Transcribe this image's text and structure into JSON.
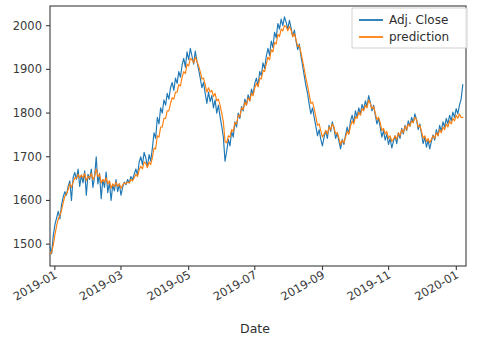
{
  "chart_data": {
    "type": "line",
    "title": "",
    "xlabel": "Date",
    "ylabel": "",
    "grid": false,
    "legend_position": "upper right",
    "xtick_labels": [
      "2019-01",
      "2019-03",
      "2019-05",
      "2019-07",
      "2019-09",
      "2019-11",
      "2020-01"
    ],
    "xtick_values": [
      0,
      41,
      83,
      124,
      166,
      207,
      249
    ],
    "ytick_labels": [
      "1500",
      "1600",
      "1700",
      "1800",
      "1900",
      "2000"
    ],
    "ytick_values": [
      1500,
      1600,
      1700,
      1800,
      1900,
      2000
    ],
    "ylim": [
      1450,
      2045
    ],
    "xlim": [
      -3,
      255
    ],
    "colors": {
      "adj_close": "#1f77b4",
      "prediction": "#ff7f0e",
      "axis": "#3b3b3b",
      "background": "#ffffff"
    },
    "series": [
      {
        "name": "Adj. Close",
        "color": "#1f77b4",
        "values": [
          1495,
          1478,
          1520,
          1545,
          1560,
          1575,
          1558,
          1590,
          1608,
          1620,
          1612,
          1632,
          1645,
          1600,
          1652,
          1664,
          1648,
          1672,
          1632,
          1658,
          1640,
          1668,
          1612,
          1660,
          1648,
          1672,
          1630,
          1655,
          1700,
          1638,
          1662,
          1604,
          1648,
          1630,
          1665,
          1618,
          1642,
          1600,
          1636,
          1622,
          1648,
          1620,
          1638,
          1612,
          1630,
          1642,
          1636,
          1648,
          1640,
          1655,
          1648,
          1660,
          1672,
          1658,
          1688,
          1700,
          1682,
          1710,
          1698,
          1676,
          1705,
          1690,
          1720,
          1755,
          1742,
          1790,
          1775,
          1812,
          1800,
          1830,
          1818,
          1845,
          1832,
          1858,
          1870,
          1852,
          1880,
          1868,
          1895,
          1882,
          1910,
          1925,
          1905,
          1940,
          1922,
          1948,
          1930,
          1912,
          1942,
          1918,
          1900,
          1880,
          1858,
          1870,
          1845,
          1822,
          1848,
          1826,
          1840,
          1812,
          1830,
          1800,
          1818,
          1792,
          1770,
          1745,
          1690,
          1712,
          1740,
          1725,
          1758,
          1745,
          1780,
          1768,
          1800,
          1788,
          1815,
          1805,
          1832,
          1818,
          1842,
          1828,
          1855,
          1842,
          1868,
          1880,
          1862,
          1895,
          1885,
          1915,
          1902,
          1930,
          1948,
          1932,
          1965,
          1950,
          1985,
          1972,
          2005,
          1992,
          2015,
          2000,
          2020,
          2008,
          1992,
          2012,
          1995,
          1975,
          1990,
          1965,
          1945,
          1958,
          1930,
          1908,
          1885,
          1862,
          1845,
          1820,
          1798,
          1812,
          1790,
          1770,
          1748,
          1762,
          1740,
          1725,
          1745,
          1760,
          1742,
          1772,
          1758,
          1780,
          1765,
          1742,
          1755,
          1735,
          1718,
          1740,
          1728,
          1750,
          1768,
          1752,
          1782,
          1795,
          1778,
          1805,
          1790,
          1812,
          1798,
          1820,
          1808,
          1828,
          1815,
          1840,
          1825,
          1805,
          1818,
          1795,
          1775,
          1788,
          1768,
          1745,
          1760,
          1738,
          1752,
          1728,
          1742,
          1720,
          1735,
          1748,
          1730,
          1755,
          1742,
          1765,
          1752,
          1772,
          1760,
          1782,
          1770,
          1790,
          1778,
          1798,
          1785,
          1762,
          1775,
          1752,
          1730,
          1745,
          1722,
          1738,
          1718,
          1735,
          1750,
          1738,
          1762,
          1748,
          1772,
          1758,
          1780,
          1768,
          1788,
          1775,
          1795,
          1782,
          1802,
          1790,
          1810,
          1798,
          1818,
          1832,
          1865
        ]
      },
      {
        "name": "prediction",
        "color": "#ff7f0e",
        "values": [
          1478,
          1482,
          1498,
          1522,
          1542,
          1558,
          1565,
          1578,
          1595,
          1610,
          1615,
          1625,
          1638,
          1630,
          1642,
          1652,
          1650,
          1660,
          1652,
          1658,
          1652,
          1662,
          1645,
          1655,
          1652,
          1662,
          1648,
          1655,
          1672,
          1655,
          1660,
          1640,
          1648,
          1642,
          1652,
          1638,
          1645,
          1628,
          1638,
          1632,
          1642,
          1632,
          1638,
          1628,
          1635,
          1640,
          1638,
          1642,
          1640,
          1648,
          1645,
          1652,
          1660,
          1655,
          1670,
          1678,
          1672,
          1688,
          1685,
          1675,
          1688,
          1682,
          1698,
          1720,
          1718,
          1748,
          1745,
          1768,
          1768,
          1788,
          1788,
          1805,
          1805,
          1822,
          1835,
          1832,
          1848,
          1848,
          1865,
          1862,
          1882,
          1895,
          1890,
          1912,
          1908,
          1925,
          1922,
          1915,
          1928,
          1918,
          1908,
          1895,
          1878,
          1880,
          1865,
          1848,
          1858,
          1848,
          1852,
          1838,
          1845,
          1828,
          1832,
          1818,
          1800,
          1780,
          1735,
          1732,
          1748,
          1745,
          1762,
          1758,
          1778,
          1775,
          1795,
          1792,
          1812,
          1808,
          1825,
          1818,
          1835,
          1828,
          1845,
          1840,
          1858,
          1868,
          1860,
          1880,
          1878,
          1898,
          1895,
          1912,
          1928,
          1922,
          1945,
          1940,
          1962,
          1958,
          1980,
          1975,
          1992,
          1988,
          2000,
          1998,
          1988,
          1998,
          1990,
          1975,
          1982,
          1968,
          1952,
          1955,
          1938,
          1920,
          1900,
          1880,
          1862,
          1842,
          1822,
          1825,
          1810,
          1792,
          1772,
          1775,
          1760,
          1745,
          1752,
          1760,
          1752,
          1768,
          1762,
          1775,
          1768,
          1752,
          1755,
          1742,
          1728,
          1738,
          1732,
          1745,
          1758,
          1752,
          1770,
          1782,
          1775,
          1792,
          1788,
          1802,
          1795,
          1810,
          1805,
          1818,
          1812,
          1830,
          1822,
          1810,
          1815,
          1800,
          1785,
          1790,
          1778,
          1760,
          1765,
          1752,
          1758,
          1742,
          1748,
          1735,
          1740,
          1748,
          1740,
          1755,
          1748,
          1762,
          1755,
          1770,
          1762,
          1775,
          1770,
          1782,
          1778,
          1790,
          1785,
          1768,
          1772,
          1758,
          1742,
          1748,
          1735,
          1742,
          1732,
          1740,
          1748,
          1742,
          1755,
          1748,
          1762,
          1755,
          1768,
          1762,
          1775,
          1768,
          1782,
          1775,
          1788,
          1782,
          1795,
          1788,
          1798,
          1790,
          1790
        ]
      }
    ]
  },
  "legend": {
    "entries": [
      {
        "label": "Adj. Close",
        "color": "#1f77b4"
      },
      {
        "label": "prediction",
        "color": "#ff7f0e"
      }
    ]
  }
}
